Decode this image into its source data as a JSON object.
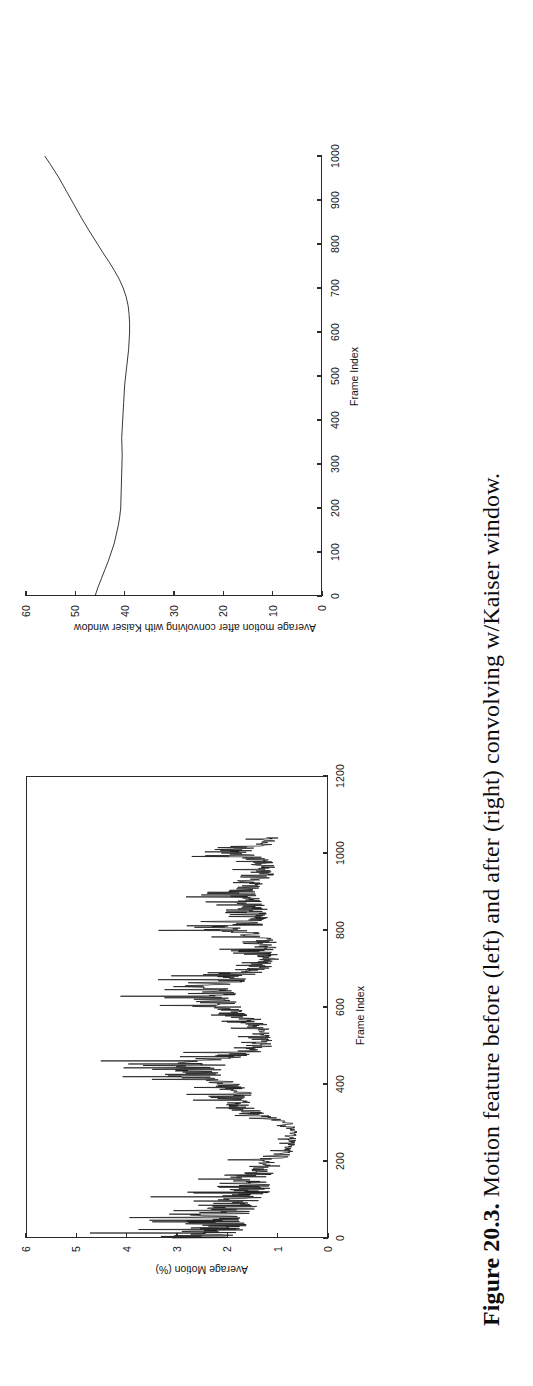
{
  "figure": {
    "label": "Figure 20.3.",
    "caption_text": "Motion feature before (left) and after (right) convolving w/Kaiser window.",
    "full_caption": "Figure 20.3. Motion feature before (left) and after (right) convolving w/Kaiser window."
  },
  "chart_data": [
    {
      "id": "left-chart",
      "type": "line",
      "title": "",
      "xlabel": "Frame Index",
      "ylabel": "Average Motion (%)",
      "xlim": [
        0,
        1200
      ],
      "ylim": [
        0,
        6
      ],
      "xticks": [
        0,
        200,
        400,
        600,
        800,
        1000,
        1200
      ],
      "xticklabels": [
        "0",
        "200",
        "400",
        "600",
        "800",
        "1000",
        "1200"
      ],
      "yticks": [
        0,
        1,
        2,
        3,
        4,
        5,
        6
      ],
      "yticklabels": [
        "0",
        "1",
        "2",
        "3",
        "4",
        "5",
        "6"
      ],
      "grid": false,
      "legend": null,
      "box": true,
      "series": [
        {
          "name": "Average motion (raw, per frame)",
          "description": "Dense noisy per-frame motion signal spanning frames 0-1050; high-variance bursts near 0-150 reaching 5.2, quiet valley 200-300 near 0.8, mid bursts 330-470 to 4.9, 560-680 to 4.2, 700-820 to 4.2, 850-1010 to 3.6.",
          "envelope_x": [
            0,
            20,
            40,
            60,
            80,
            100,
            120,
            140,
            160,
            180,
            200,
            220,
            250,
            280,
            300,
            320,
            340,
            360,
            380,
            400,
            420,
            440,
            460,
            480,
            500,
            520,
            540,
            560,
            580,
            600,
            620,
            640,
            660,
            680,
            700,
            720,
            740,
            760,
            780,
            800,
            820,
            840,
            860,
            880,
            900,
            920,
            940,
            960,
            980,
            1000,
            1020,
            1040
          ],
          "envelope_hi": [
            5.2,
            5.1,
            5.0,
            4.7,
            4.3,
            3.9,
            3.4,
            3.0,
            3.3,
            2.6,
            2.1,
            1.4,
            1.1,
            1.0,
            1.3,
            2.6,
            3.0,
            2.9,
            3.1,
            3.3,
            4.6,
            4.9,
            4.6,
            3.1,
            2.1,
            1.9,
            2.0,
            2.4,
            3.2,
            3.9,
            4.2,
            4.1,
            3.9,
            3.4,
            2.5,
            2.2,
            2.2,
            2.3,
            2.2,
            4.2,
            2.6,
            2.4,
            2.6,
            2.9,
            3.0,
            2.4,
            2.1,
            2.0,
            2.2,
            3.6,
            2.2,
            1.6
          ],
          "envelope_lo": [
            0.9,
            0.7,
            0.6,
            0.7,
            0.6,
            0.5,
            0.5,
            0.6,
            0.5,
            0.5,
            0.5,
            0.5,
            0.5,
            0.5,
            0.5,
            0.8,
            1.0,
            1.0,
            1.1,
            1.3,
            1.4,
            1.3,
            1.1,
            0.9,
            0.8,
            0.8,
            0.9,
            0.9,
            1.0,
            1.1,
            1.1,
            1.0,
            0.9,
            0.9,
            0.7,
            0.6,
            0.6,
            0.6,
            0.6,
            0.7,
            0.8,
            0.8,
            0.8,
            0.9,
            1.0,
            0.9,
            0.8,
            0.7,
            0.8,
            0.9,
            0.8,
            0.7
          ],
          "mean_x": [
            0,
            50,
            100,
            150,
            200,
            250,
            300,
            350,
            400,
            450,
            500,
            550,
            600,
            650,
            700,
            750,
            800,
            850,
            900,
            950,
            1000,
            1050
          ],
          "mean_y": [
            2.4,
            2.5,
            1.9,
            1.5,
            0.9,
            0.8,
            0.9,
            1.8,
            2.1,
            2.4,
            1.3,
            1.4,
            2.3,
            2.5,
            1.4,
            1.4,
            1.7,
            1.5,
            1.7,
            1.3,
            1.5,
            1.0
          ]
        }
      ]
    },
    {
      "id": "right-chart",
      "type": "line",
      "title": "",
      "xlabel": "Frame Index",
      "ylabel": "Average motion after convolving with Kaiser window",
      "xlim": [
        0,
        1000
      ],
      "ylim": [
        0,
        60
      ],
      "xticks": [
        0,
        100,
        200,
        300,
        400,
        500,
        600,
        700,
        800,
        900,
        1000
      ],
      "xticklabels": [
        "0",
        "100",
        "200",
        "300",
        "400",
        "500",
        "600",
        "700",
        "800",
        "900",
        "1000"
      ],
      "yticks": [
        0,
        10,
        20,
        30,
        40,
        50,
        60
      ],
      "yticklabels": [
        "0",
        "10",
        "20",
        "30",
        "40",
        "50",
        "60"
      ],
      "grid": false,
      "legend": null,
      "box": false,
      "series": [
        {
          "name": "Average motion after convolving with Kaiser window",
          "description": "Smooth curve: starts at 46 at frame 0, falls to ~41 by frame 180, remains near 40-41 through frame 560, dips to minimum 39 near 620, then rises steadily to 56 at frame 1000.",
          "x": [
            0,
            20,
            40,
            60,
            80,
            100,
            120,
            140,
            160,
            180,
            200,
            240,
            280,
            320,
            360,
            400,
            440,
            480,
            520,
            560,
            600,
            620,
            640,
            660,
            680,
            700,
            720,
            740,
            760,
            780,
            800,
            830,
            860,
            890,
            920,
            950,
            980,
            1000
          ],
          "y": [
            46.0,
            45.4,
            44.7,
            44.0,
            43.3,
            42.7,
            42.1,
            41.7,
            41.3,
            41.0,
            40.8,
            40.7,
            40.6,
            40.5,
            40.6,
            40.4,
            40.2,
            40.0,
            39.6,
            39.2,
            39.0,
            39.0,
            39.1,
            39.3,
            39.7,
            40.3,
            41.1,
            42.1,
            43.2,
            44.4,
            45.5,
            47.2,
            48.8,
            50.3,
            51.8,
            53.3,
            55.0,
            56.2
          ]
        }
      ]
    }
  ]
}
